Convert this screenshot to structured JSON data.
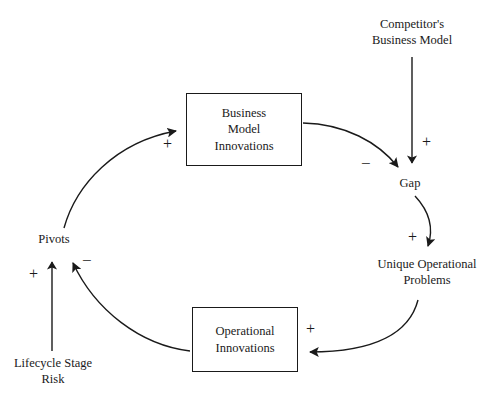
{
  "diagram": {
    "type": "causal-loop-diagram",
    "background_color": "#ffffff",
    "stroke_color": "#1a1a1a",
    "nodes": {
      "competitors_business_model": {
        "label_lines": [
          "Competitor's",
          "Business Model"
        ],
        "shape": "text"
      },
      "business_model_innovations": {
        "label_lines": [
          "Business",
          "Model",
          "Innovations"
        ],
        "shape": "box"
      },
      "gap": {
        "label_lines": [
          "Gap"
        ],
        "shape": "text"
      },
      "unique_operational_problems": {
        "label_lines": [
          "Unique Operational",
          "Problems"
        ],
        "shape": "text"
      },
      "operational_innovations": {
        "label_lines": [
          "Operational",
          "Innovations"
        ],
        "shape": "box"
      },
      "pivots": {
        "label_lines": [
          "Pivots"
        ],
        "shape": "text"
      },
      "lifecycle_stage_risk": {
        "label_lines": [
          "Lifecycle Stage",
          "Risk"
        ],
        "shape": "text"
      }
    },
    "edges": [
      {
        "id": "competitor-to-gap",
        "from": "competitors_business_model",
        "to": "gap",
        "polarity": "+",
        "style": "straight"
      },
      {
        "id": "bmi-to-gap",
        "from": "business_model_innovations",
        "to": "gap",
        "polarity": "−",
        "style": "curved"
      },
      {
        "id": "gap-to-uop",
        "from": "gap",
        "to": "unique_operational_problems",
        "polarity": "+",
        "style": "curved"
      },
      {
        "id": "uop-to-oi",
        "from": "unique_operational_problems",
        "to": "operational_innovations",
        "polarity": "+",
        "style": "curved"
      },
      {
        "id": "oi-to-pivots",
        "from": "operational_innovations",
        "to": "pivots",
        "polarity": "−",
        "style": "curved"
      },
      {
        "id": "lifecycle-to-pivots",
        "from": "lifecycle_stage_risk",
        "to": "pivots",
        "polarity": "+",
        "style": "straight"
      },
      {
        "id": "pivots-to-bmi",
        "from": "pivots",
        "to": "business_model_innovations",
        "polarity": "+",
        "style": "curved"
      }
    ]
  }
}
